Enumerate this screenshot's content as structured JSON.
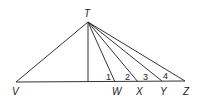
{
  "diagram": {
    "type": "geometry",
    "points": {
      "T": {
        "label": "T",
        "x": 88,
        "y": 22
      },
      "V": {
        "label": "V",
        "x": 16,
        "y": 82
      },
      "F": {
        "x": 88,
        "y": 82
      },
      "W": {
        "label": "W",
        "x": 115,
        "y": 82
      },
      "X": {
        "label": "X",
        "x": 138,
        "y": 82
      },
      "Y": {
        "label": "Y",
        "x": 162,
        "y": 82
      },
      "Z": {
        "label": "Z",
        "x": 185,
        "y": 82
      }
    },
    "segments": [
      "TV",
      "TF",
      "TW",
      "TX",
      "TY",
      "TZ",
      "VZ"
    ],
    "angle_labels": [
      "1",
      "2",
      "3",
      "4"
    ],
    "stroke_color": "#333333"
  }
}
